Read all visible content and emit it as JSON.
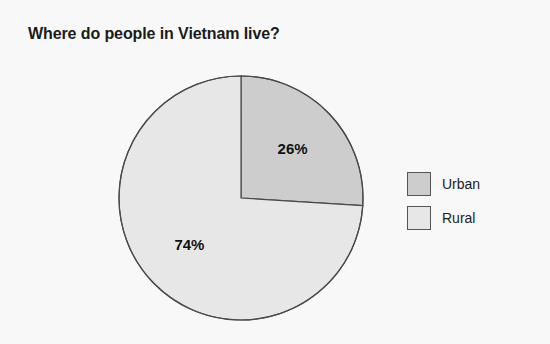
{
  "chart_data": {
    "type": "pie",
    "title": "Where do people in Vietnam live?",
    "categories": [
      "Urban",
      "Rural"
    ],
    "values": [
      26,
      74
    ],
    "value_unit": "%",
    "data_labels": [
      "26%",
      "74%"
    ],
    "colors": [
      "#cdcdcd",
      "#e7e7e7"
    ],
    "slice_outline_color": "#4a4a4a",
    "start_angle_deg": 0,
    "direction": "clockwise",
    "legend_position": "right",
    "grid": false,
    "xlabel": "",
    "ylabel": "",
    "background_color": "#f8f8f8",
    "slices": [
      {
        "name": "Urban",
        "value": 26,
        "label": "26%",
        "color": "#cdcdcd",
        "start_angle_deg": 0,
        "sweep_angle_deg": 93.6
      },
      {
        "name": "Rural",
        "value": 74,
        "label": "74%",
        "color": "#e7e7e7",
        "start_angle_deg": 93.6,
        "sweep_angle_deg": 266.4
      }
    ]
  },
  "legend": {
    "items": [
      {
        "label": "Urban",
        "color": "#cdcdcd"
      },
      {
        "label": "Rural",
        "color": "#e7e7e7"
      }
    ]
  }
}
